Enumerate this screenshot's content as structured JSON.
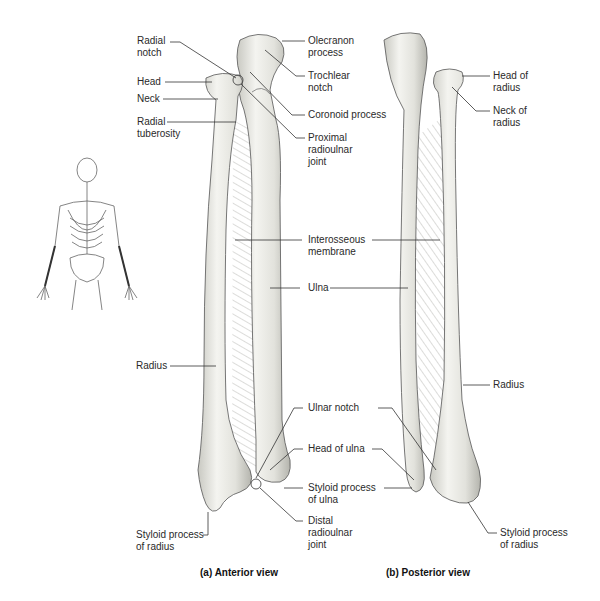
{
  "figure": {
    "panels": [
      {
        "id": "a",
        "caption": "(a) Anterior view",
        "labels": {
          "radial_notch": "Radial\nnotch",
          "head": "Head",
          "neck": "Neck",
          "radial_tuberosity": "Radial\ntuberosity",
          "olecranon_process": "Olecranon\nprocess",
          "trochlear_notch": "Trochlear\nnotch",
          "coronoid_process": "Coronoid process",
          "proximal_radioulnar_joint": "Proximal\nradioulnar\njoint",
          "interosseous_membrane": "Interosseous\nmembrane",
          "ulna": "Ulna",
          "radius": "Radius",
          "ulnar_notch": "Ulnar notch",
          "head_of_ulna": "Head of ulna",
          "styloid_process_of_ulna": "Styloid process\nof ulna",
          "distal_radioulnar_joint": "Distal\nradioulnar\njoint",
          "styloid_process_of_radius": "Styloid process\nof radius"
        }
      },
      {
        "id": "b",
        "caption": "(b) Posterior view",
        "labels": {
          "head_of_radius": "Head of\nradius",
          "neck_of_radius": "Neck of\nradius",
          "radius": "Radius",
          "styloid_process_of_radius": "Styloid process\nof radius"
        }
      }
    ],
    "orientation_icon": "skeleton-icon",
    "colors": {
      "bone_fill": "#eeeeea",
      "bone_shade": "#bdbdb6",
      "outline": "#555555",
      "leader_line": "#333333",
      "membrane": "#9a9a94"
    }
  }
}
